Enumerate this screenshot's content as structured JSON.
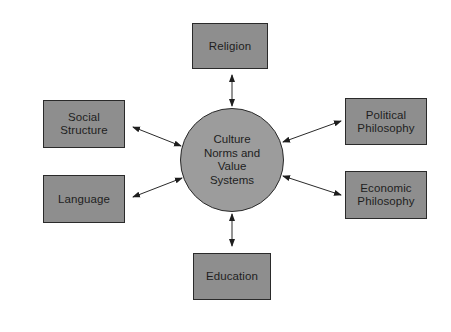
{
  "diagram": {
    "type": "hub-and-spoke",
    "center": {
      "label": "Culture\nNorms and\nValue\nSystems",
      "cx": 232,
      "cy": 160,
      "r": 52
    },
    "nodes": [
      {
        "id": "religion",
        "label": "Religion",
        "x": 192,
        "y": 23,
        "w": 76,
        "h": 46
      },
      {
        "id": "social-structure",
        "label": "Social\nStructure",
        "x": 43,
        "y": 100,
        "w": 82,
        "h": 48
      },
      {
        "id": "language",
        "label": "Language",
        "x": 43,
        "y": 175,
        "w": 82,
        "h": 48
      },
      {
        "id": "political-philosophy",
        "label": "Political\nPhilosophy",
        "x": 345,
        "y": 98,
        "w": 82,
        "h": 47
      },
      {
        "id": "economic-philosophy",
        "label": "Economic\nPhilosophy",
        "x": 345,
        "y": 171,
        "w": 82,
        "h": 48
      },
      {
        "id": "education",
        "label": "Education",
        "x": 193,
        "y": 253,
        "w": 78,
        "h": 47
      }
    ],
    "edges": [
      {
        "from": "religion",
        "to": "center",
        "bidirectional": true,
        "x1": 232,
        "y1": 75,
        "x2": 232,
        "y2": 106
      },
      {
        "from": "social-structure",
        "to": "center",
        "bidirectional": true,
        "x1": 133,
        "y1": 127,
        "x2": 181,
        "y2": 146
      },
      {
        "from": "language",
        "to": "center",
        "bidirectional": true,
        "x1": 133,
        "y1": 197,
        "x2": 182,
        "y2": 178
      },
      {
        "from": "political-philosophy",
        "to": "center",
        "bidirectional": true,
        "x1": 341,
        "y1": 121,
        "x2": 283,
        "y2": 142
      },
      {
        "from": "economic-philosophy",
        "to": "center",
        "bidirectional": true,
        "x1": 341,
        "y1": 195,
        "x2": 283,
        "y2": 176
      },
      {
        "from": "education",
        "to": "center",
        "bidirectional": true,
        "x1": 232,
        "y1": 246,
        "x2": 232,
        "y2": 214
      }
    ],
    "colors": {
      "background": "#ffffff",
      "box_fill": "#8e8e8e",
      "circle_fill": "#9c9c9c",
      "stroke": "#2a2a2a",
      "text": "#1e1e1e"
    }
  }
}
